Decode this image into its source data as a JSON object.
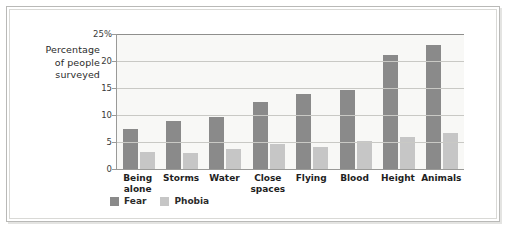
{
  "chart_data": {
    "type": "bar",
    "title": "",
    "xlabel": "",
    "ylabel": "Percentage of people surveyed",
    "ylim": [
      0,
      25
    ],
    "grid": true,
    "legend_position": "bottom-left",
    "categories": [
      "Being alone",
      "Storms",
      "Water",
      "Close spaces",
      "Flying",
      "Blood",
      "Height",
      "Animals"
    ],
    "category_lines": [
      [
        "Being",
        "alone"
      ],
      [
        "Storms"
      ],
      [
        "Water"
      ],
      [
        "Close",
        "spaces"
      ],
      [
        "Flying"
      ],
      [
        "Blood"
      ],
      [
        "Height"
      ],
      [
        "Animals"
      ]
    ],
    "ytick_labels": [
      "25%",
      "20",
      "15",
      "10",
      "5",
      "0"
    ],
    "ytick_values": [
      25,
      20,
      15,
      10,
      5,
      0
    ],
    "series": [
      {
        "name": "Fear",
        "color": "#8a8a8a",
        "values": [
          7.4,
          8.9,
          9.7,
          12.4,
          13.8,
          14.6,
          21.2,
          23.0
        ]
      },
      {
        "name": "Phobia",
        "color": "#c6c6c6",
        "values": [
          3.1,
          3.0,
          3.7,
          4.7,
          4.1,
          5.2,
          6.0,
          6.7
        ]
      }
    ]
  },
  "axis_title": {
    "line1": "Percentage",
    "line2": "of people",
    "line3": "surveyed"
  },
  "colors": {
    "fear": "#8a8a8a",
    "phobia": "#c6c6c6",
    "grid": "#c9c9c5",
    "axis": "#9a9a98",
    "plot_background": "#f8f8f6",
    "frame": "#b9b9b7"
  }
}
